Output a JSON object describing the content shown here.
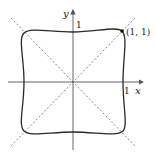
{
  "figure": {
    "type": "parametric curve plot",
    "axes": {
      "x_label": "x",
      "y_label": "y",
      "x_tick": "1",
      "y_tick": "1"
    },
    "point": {
      "label": "(1, 1)",
      "x": 1,
      "y": 1
    },
    "guide_lines": [
      "y = x",
      "y = -x"
    ],
    "colors": {
      "curve": "#2a2a2a",
      "axes": "#555555",
      "dashed": "#666666",
      "text": "#222222"
    }
  }
}
